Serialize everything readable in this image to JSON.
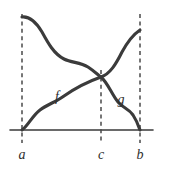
{
  "figure": {
    "kind": "line-diagram",
    "background_color": "#ffffff",
    "ink_color": "#3b3b3b",
    "axis_color": "#3a3a3a",
    "dash_color": "#4a4a4a"
  },
  "axis": {
    "name": "horizontal-axis",
    "y": 130,
    "x_start": 10,
    "x_end": 153
  },
  "ticks": [
    {
      "id": "a",
      "label": "a",
      "x": 22,
      "dash_top": 14,
      "dash_bottom": 143
    },
    {
      "id": "c",
      "label": "c",
      "x": 101,
      "dash_top": 70,
      "dash_bottom": 143
    },
    {
      "id": "b",
      "label": "b",
      "x": 140,
      "dash_top": 14,
      "dash_bottom": 143
    }
  ],
  "curve_labels": {
    "f": "f",
    "g": "g"
  },
  "chart_data": {
    "type": "line",
    "title": "",
    "xlabel": "",
    "ylabel": "",
    "grid": false,
    "legend": "inline-curve-labels",
    "xlim": [
      22,
      140
    ],
    "ylim": [
      0,
      1
    ],
    "x_tick_labels": [
      "a",
      "c",
      "b"
    ],
    "x_tick_positions": [
      22,
      101,
      140
    ],
    "crossing_point": {
      "x": 101,
      "y": 77,
      "x_label": "c"
    },
    "series": [
      {
        "name": "f",
        "description": "increasing curve from zero at a to maximum at b",
        "path": "M 22 130 C 28 126, 32 116, 40 110 C 48 104, 56 102, 64 96 C 74 89, 84 83, 101 77 C 110 74, 116 64, 122 52 C 128 41, 134 34, 140 30"
      },
      {
        "name": "g",
        "description": "decreasing curve from maximum at a to zero at b",
        "path": "M 22 17 C 30 16, 36 22, 42 32 C 48 43, 54 54, 64 59 C 72 63, 80 62, 88 67 C 94 71, 97 74, 101 77 C 108 83, 112 95, 118 102 C 124 109, 128 108, 133 115 C 137 121, 139 127, 140 130"
      }
    ]
  }
}
